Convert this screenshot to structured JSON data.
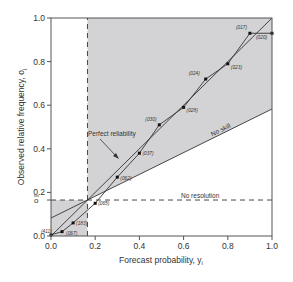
{
  "chart_data": {
    "type": "line",
    "title": "",
    "xlabel": "Forecast probability, y",
    "xlabel_sub": "i",
    "ylabel": "Observed relative frequency, o",
    "ylabel_sub": "j",
    "xlim": [
      0,
      1
    ],
    "ylim": [
      0,
      1
    ],
    "xticks": [
      "0.0",
      "0.2",
      "0.4",
      "0.6",
      "0.8",
      "1.0"
    ],
    "yticks": [
      "0.0",
      "0.2",
      "0.4",
      "0.6",
      "0.8",
      "1.0"
    ],
    "climatology": 0.165,
    "climatology_label": "o",
    "grid": false,
    "series": [
      {
        "name": "Reliability curve",
        "points": [
          {
            "x": 0.0,
            "y": 0.005,
            "label": "(411)"
          },
          {
            "x": 0.05,
            "y": 0.02,
            "label": "(067)"
          },
          {
            "x": 0.1,
            "y": 0.06,
            "label": "(183)"
          },
          {
            "x": 0.2,
            "y": 0.15,
            "label": "(065)"
          },
          {
            "x": 0.3,
            "y": 0.27,
            "label": "(062)"
          },
          {
            "x": 0.4,
            "y": 0.38,
            "label": "(037)"
          },
          {
            "x": 0.49,
            "y": 0.51,
            "label": "(030)"
          },
          {
            "x": 0.6,
            "y": 0.59,
            "label": "(028)"
          },
          {
            "x": 0.7,
            "y": 0.72,
            "label": "(024)"
          },
          {
            "x": 0.8,
            "y": 0.79,
            "label": "(023)"
          },
          {
            "x": 0.9,
            "y": 0.93,
            "label": "(017)"
          },
          {
            "x": 1.0,
            "y": 0.93,
            "label": "(020)"
          }
        ]
      },
      {
        "name": "Perfect reliability",
        "x": [
          0,
          1
        ],
        "y": [
          0,
          1
        ]
      },
      {
        "name": "No skill",
        "x": [
          0,
          1
        ],
        "y": [
          0.0825,
          0.5825
        ]
      },
      {
        "name": "No resolution",
        "x": [
          0,
          1
        ],
        "y": [
          0.165,
          0.165
        ]
      }
    ],
    "annotations": [
      "Perfect reliability",
      "No skill",
      "No resolution"
    ],
    "colors": {
      "shade": "#d3d3d6",
      "line": "#333333",
      "axis": "#555555"
    }
  }
}
